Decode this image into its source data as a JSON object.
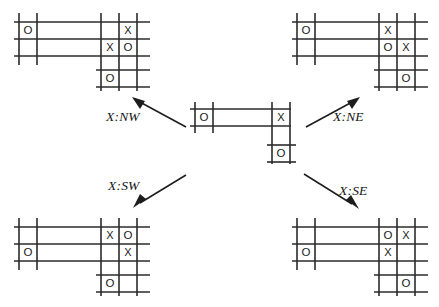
{
  "figure": {
    "line_color": "#2b2b2b",
    "mark_color": "#1a1a1a",
    "arrow_color": "#1c1c1c",
    "background": "#ffffff"
  },
  "labels": {
    "nw": "X:NW",
    "ne": "X:NE",
    "sw": "X:SW",
    "se": "X:SE"
  },
  "boards": {
    "center": {
      "name": "center-board",
      "marks": [
        {
          "glyph": "O",
          "cell": "left-top"
        },
        {
          "glyph": "X",
          "cell": "right-top"
        },
        {
          "glyph": "O",
          "cell": "lower-extension"
        }
      ]
    },
    "top_left": {
      "name": "board-nw",
      "marks": [
        {
          "glyph": "O",
          "cell": "left-top"
        },
        {
          "glyph": "X",
          "cell": "far-right-top"
        },
        {
          "glyph": "X",
          "cell": "right-middle"
        },
        {
          "glyph": "O",
          "cell": "far-right-middle"
        },
        {
          "glyph": "O",
          "cell": "lower-extension"
        }
      ]
    },
    "top_right": {
      "name": "board-ne",
      "marks": [
        {
          "glyph": "O",
          "cell": "left-top"
        },
        {
          "glyph": "X",
          "cell": "right-top"
        },
        {
          "glyph": "O",
          "cell": "right-middle"
        },
        {
          "glyph": "X",
          "cell": "far-right-middle"
        },
        {
          "glyph": "O",
          "cell": "lower-extension-right"
        }
      ]
    },
    "bottom_left": {
      "name": "board-sw",
      "marks": [
        {
          "glyph": "X",
          "cell": "right-top"
        },
        {
          "glyph": "O",
          "cell": "far-right-top"
        },
        {
          "glyph": "O",
          "cell": "left-middle"
        },
        {
          "glyph": "X",
          "cell": "far-right-middle"
        },
        {
          "glyph": "O",
          "cell": "lower-extension"
        }
      ]
    },
    "bottom_right": {
      "name": "board-se",
      "marks": [
        {
          "glyph": "O",
          "cell": "right-top"
        },
        {
          "glyph": "X",
          "cell": "far-right-top"
        },
        {
          "glyph": "O",
          "cell": "left-middle"
        },
        {
          "glyph": "X",
          "cell": "right-middle"
        },
        {
          "glyph": "O",
          "cell": "lower-extension-right"
        }
      ]
    }
  },
  "arrows": [
    {
      "name": "arrow-nw",
      "direction": "up-left"
    },
    {
      "name": "arrow-ne",
      "direction": "up-right"
    },
    {
      "name": "arrow-sw",
      "direction": "down-left"
    },
    {
      "name": "arrow-se",
      "direction": "down-right"
    }
  ]
}
